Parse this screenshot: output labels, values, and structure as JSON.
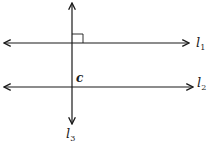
{
  "diagram": {
    "type": "geometry-lines",
    "colors": {
      "line": "#1a1a1a",
      "background": "#ffffff"
    },
    "lines": [
      {
        "id": "l1",
        "label_main": "l",
        "label_sub": "1",
        "orientation": "horizontal"
      },
      {
        "id": "l2",
        "label_main": "l",
        "label_sub": "2",
        "orientation": "horizontal"
      },
      {
        "id": "l3",
        "label_main": "l",
        "label_sub": "3",
        "orientation": "vertical"
      }
    ],
    "angle_marker": {
      "type": "right-angle",
      "at": "l3 ∩ l1"
    },
    "point_label": "c"
  }
}
